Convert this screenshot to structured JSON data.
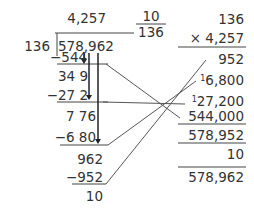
{
  "division": {
    "quotient": "4,257",
    "remainder_fraction": {
      "numerator": "10",
      "denominator": "136"
    },
    "divisor": "136",
    "dividend": "578,962",
    "steps": [
      {
        "subtract": "−544"
      },
      {
        "partial": "34 9"
      },
      {
        "subtract": "−27 2"
      },
      {
        "partial": "7 76"
      },
      {
        "subtract": "−6 80"
      },
      {
        "partial": "962"
      },
      {
        "subtract": "−952"
      },
      {
        "remainder": "10"
      }
    ]
  },
  "check": {
    "multiplicand": "136",
    "multiplier": "× 4,257",
    "partials": [
      {
        "carry": "",
        "value": "952"
      },
      {
        "carry": "1",
        "value": "6,800"
      },
      {
        "carry": "1",
        "value": "27,200"
      },
      {
        "carry": "",
        "value": "544,000"
      }
    ],
    "product": "578,952",
    "add_remainder": "10",
    "total": "578,962"
  },
  "colors": {
    "text": "#333333",
    "lines": "#444444"
  }
}
